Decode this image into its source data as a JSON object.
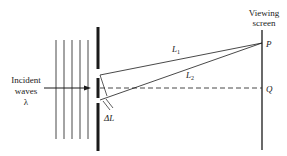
{
  "diagram": {
    "labels": {
      "incident_line1": "Incident",
      "incident_line2": "waves",
      "wavelength": "λ",
      "screen_line1": "Viewing",
      "screen_line2": "screen",
      "point_p": "P",
      "point_q": "Q",
      "path1": "L",
      "path1_sub": "1",
      "path2": "L",
      "path2_sub": "2",
      "path_difference": "ΔL"
    },
    "wavefront_count": 5,
    "colors": {
      "ink": "#1a1a1a",
      "background": "#ffffff"
    }
  }
}
